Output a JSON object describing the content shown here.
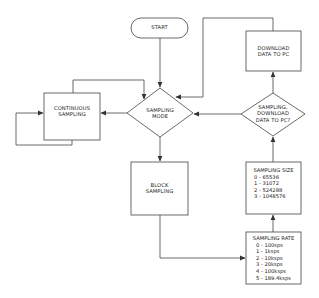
{
  "diagram": {
    "type": "flowchart",
    "colors": {
      "stroke": "#444444",
      "text": "#222222",
      "background": "#ffffff"
    },
    "nodes": {
      "start": {
        "shape": "terminator",
        "label": "START"
      },
      "sampling_mode": {
        "shape": "decision",
        "line1": "SAMPLING",
        "line2": "MODE"
      },
      "continuous_sampling": {
        "shape": "process",
        "line1": "CONTINUOUS",
        "line2": "SAMPLING"
      },
      "block_sampling": {
        "shape": "process",
        "line1": "BLOCK",
        "line2": "SAMPLING"
      },
      "download_data": {
        "shape": "process",
        "line1": "DOWNLOAD",
        "line2": "DATA TO PC"
      },
      "download_decision": {
        "shape": "decision",
        "line1": "SAMPLING,",
        "line2": "DOWNLOAD",
        "line3": "DATA TO PC?"
      },
      "sampling_size": {
        "shape": "process",
        "title": "SAMPLING SIZE",
        "options": [
          "0 - 65536",
          "1 - 31072",
          "2 - 524288",
          "3 - 1048576"
        ]
      },
      "sampling_rate": {
        "shape": "process",
        "title": "SAMPLING RATE",
        "options": [
          "0 - 100sps",
          "1 - 1ksps",
          "2 - 10ksps",
          "3 - 20ksps",
          "4 - 100ksps",
          "5 - 189.4ksps"
        ]
      }
    },
    "edges": [
      {
        "from": "START",
        "to": "SAMPLING MODE"
      },
      {
        "from": "SAMPLING MODE",
        "to": "CONTINUOUS SAMPLING"
      },
      {
        "from": "CONTINUOUS SAMPLING",
        "to": "SAMPLING MODE"
      },
      {
        "from": "CONTINUOUS SAMPLING",
        "to": "CONTINUOUS SAMPLING"
      },
      {
        "from": "SAMPLING MODE",
        "to": "BLOCK SAMPLING"
      },
      {
        "from": "BLOCK SAMPLING",
        "to": "SAMPLING RATE"
      },
      {
        "from": "SAMPLING RATE",
        "to": "SAMPLING SIZE"
      },
      {
        "from": "SAMPLING SIZE",
        "to": "SAMPLING, DOWNLOAD DATA TO PC?"
      },
      {
        "from": "SAMPLING, DOWNLOAD DATA TO PC?",
        "to": "DOWNLOAD DATA TO PC"
      },
      {
        "from": "SAMPLING, DOWNLOAD DATA TO PC?",
        "to": "SAMPLING MODE"
      },
      {
        "from": "DOWNLOAD DATA TO PC",
        "to": "SAMPLING MODE"
      }
    ]
  }
}
